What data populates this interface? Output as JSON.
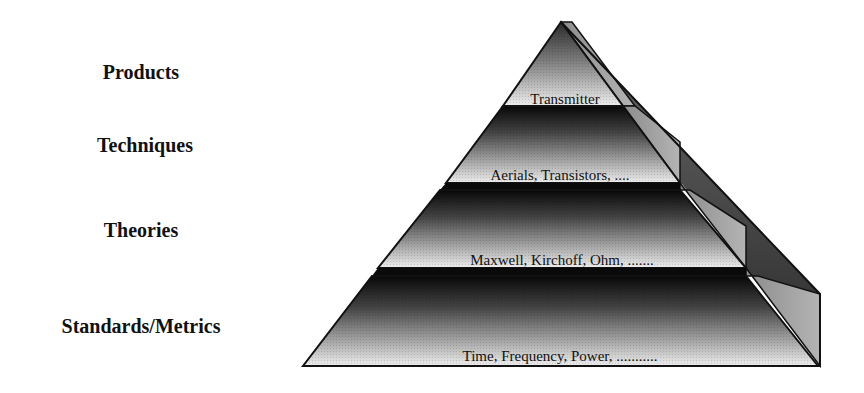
{
  "diagram": {
    "type": "pyramid",
    "levels": [
      {
        "label": "Products",
        "content": "Transmitter"
      },
      {
        "label": "Techniques",
        "content": "Aerials, Transistors, ...."
      },
      {
        "label": "Theories",
        "content": "Maxwell, Kirchoff, Ohm, ......."
      },
      {
        "label": "Standards/Metrics",
        "content": "Time, Frequency, Power,  ..........."
      }
    ],
    "colors": {
      "tier_top": "#0a0a0a",
      "tier_bottom": "#f0f0f0",
      "side_wall": "#9a9a9a",
      "outline": "#111111",
      "background": "#ffffff"
    }
  }
}
